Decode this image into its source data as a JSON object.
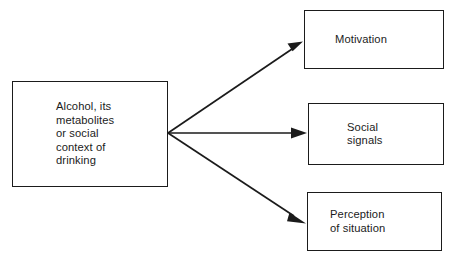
{
  "diagram": {
    "type": "flowchart",
    "title": "",
    "background_color": "#ffffff",
    "line_color": "#1b1b1b",
    "text_color": "#1b1b1b",
    "nodes": [
      {
        "id": "source",
        "label": "Alcohol, its\nmetabolites\nor social\ncontext of\ndrinking",
        "shape": "rectangle"
      },
      {
        "id": "motivation",
        "label": "Motivation",
        "shape": "rectangle"
      },
      {
        "id": "social",
        "label": "Social\nsignals",
        "shape": "rectangle"
      },
      {
        "id": "perception",
        "label": "Perception\nof situation",
        "shape": "rectangle"
      }
    ],
    "edges": [
      {
        "id": "edge-source-motivation",
        "from": "source",
        "to": "motivation",
        "style": "solid",
        "arrowhead": "filled-triangle"
      },
      {
        "id": "edge-source-social",
        "from": "source",
        "to": "social",
        "style": "solid",
        "arrowhead": "filled-triangle"
      },
      {
        "id": "edge-source-perception",
        "from": "source",
        "to": "perception",
        "style": "solid",
        "arrowhead": "filled-triangle"
      }
    ]
  }
}
